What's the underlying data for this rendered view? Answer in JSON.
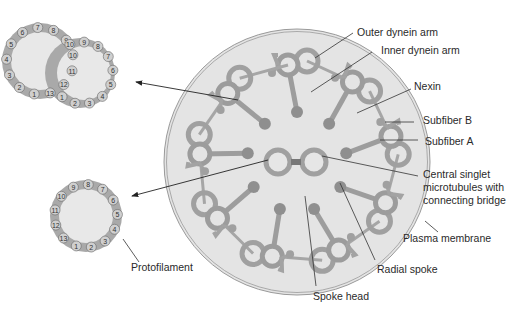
{
  "labels": {
    "outer_dynein_arm": "Outer dynein arm",
    "inner_dynein_arm": "Inner dynein arm",
    "nexin": "Nexin",
    "subfiber_b": "Subfiber B",
    "subfiber_a": "Subfiber A",
    "central_singlet_line1": "Central singlet",
    "central_singlet_line2": "microtubules with",
    "central_singlet_line3": "connecting bridge",
    "plasma_membrane": "Plasma membrane",
    "radial_spoke": "Radial spoke",
    "spoke_head": "Spoke head",
    "protofilament": "Protofilament"
  },
  "doublet_inset": {
    "subfiber_a_numbers": [
      "1",
      "2",
      "3",
      "4",
      "5",
      "6",
      "7",
      "8",
      "9",
      "10",
      "11",
      "12",
      "13"
    ],
    "subfiber_b_numbers": [
      "1",
      "2",
      "3",
      "4",
      "5",
      "6",
      "7",
      "8",
      "9",
      "10"
    ]
  },
  "singlet_inset": {
    "numbers": [
      "1",
      "2",
      "3",
      "4",
      "5",
      "6",
      "7",
      "8",
      "9",
      "10",
      "11",
      "12",
      "13"
    ]
  },
  "colors": {
    "fill_light": "#e6e6e6",
    "ring_gray": "#a8a8a8",
    "protofilament_fill": "#cfcfcf",
    "line": "#333333"
  }
}
